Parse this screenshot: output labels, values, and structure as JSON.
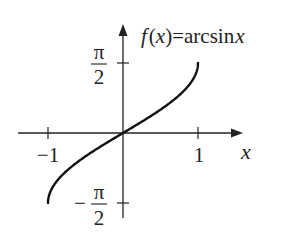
{
  "chart_data": {
    "type": "line",
    "title_parts": {
      "f": "f",
      "lp": "(",
      "x": "x",
      "rp": ")",
      "eq": "=",
      "fn": "arcsin",
      "arg": "x"
    },
    "xlabel": "x",
    "ylabel": "",
    "xlim": [
      -1,
      1
    ],
    "ylim": [
      -1.5708,
      1.5708
    ],
    "x_ticks": [
      {
        "value": -1,
        "label": "−1"
      },
      {
        "value": 1,
        "label": "1"
      }
    ],
    "y_ticks": [
      {
        "value": 1.5708,
        "label_num": "π",
        "label_den": "2",
        "sign": ""
      },
      {
        "value": -1.5708,
        "label_num": "π",
        "label_den": "2",
        "sign": "−"
      }
    ],
    "grid": false,
    "series": [
      {
        "name": "arcsin x",
        "color": "#111111",
        "x": [
          -1,
          -0.9,
          -0.75,
          -0.5,
          -0.25,
          0,
          0.25,
          0.5,
          0.75,
          0.9,
          1
        ],
        "y": [
          -1.5708,
          -1.1198,
          -0.8481,
          -0.5236,
          -0.2527,
          0,
          0.2527,
          0.5236,
          0.8481,
          1.1198,
          1.5708
        ]
      }
    ]
  }
}
